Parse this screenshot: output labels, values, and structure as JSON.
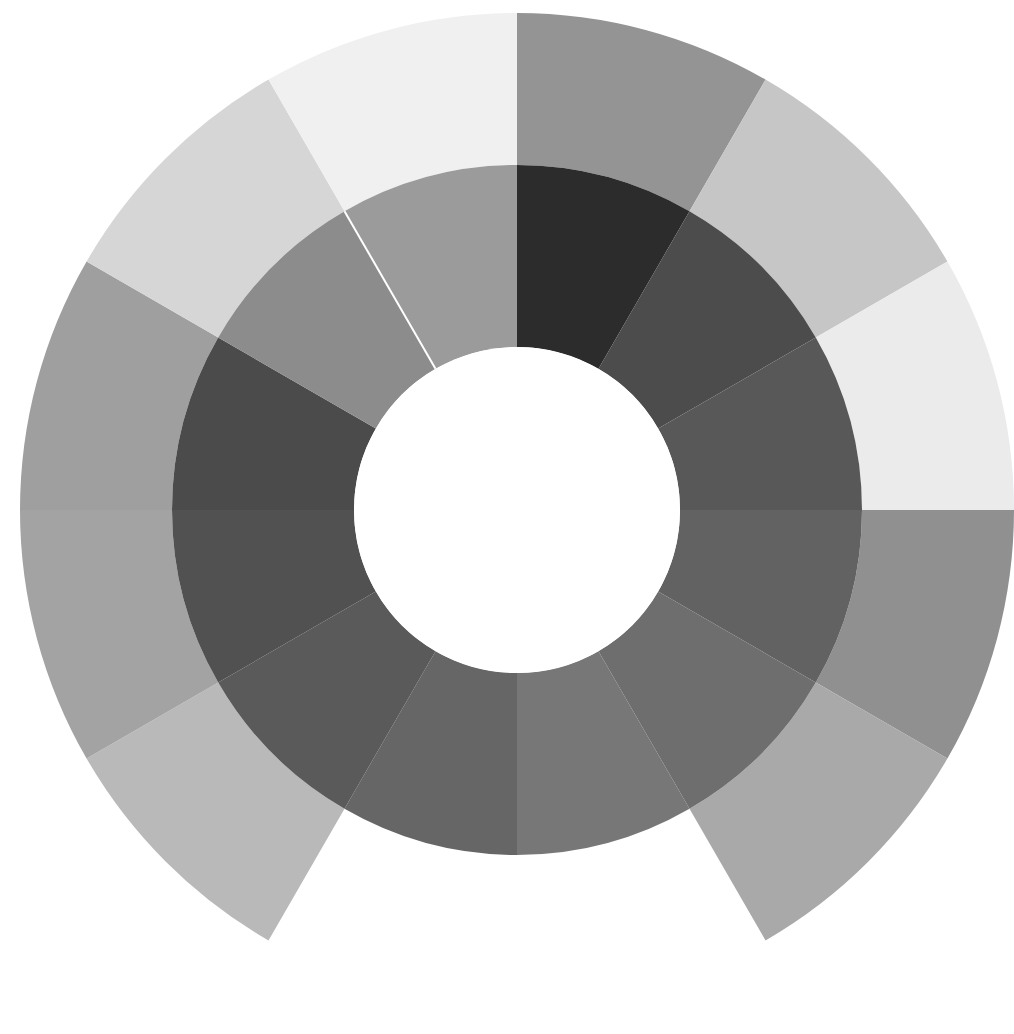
{
  "figure": {
    "kind": "spiral-value-wheel",
    "background_color": "#ffffff",
    "canvas": {
      "width": 1014,
      "height": 1034
    }
  },
  "geometry": {
    "center_x": 517,
    "center_y": 510,
    "hub_radius": 163,
    "inner_ring_inner_radius": 163,
    "inner_ring_outer_radius": 345,
    "outer_ring_inner_radius": 345,
    "outer_ring_outer_radius": 497,
    "sector_count": 12,
    "sector_degrees": 30,
    "start_angle_deg": 0,
    "direction": "clockwise",
    "outer_ring_sweep_deg": 330,
    "inner_ring_sweep_deg": 360,
    "spiral_seam_angle_deg": 330,
    "hub_color": "#ffffff"
  },
  "chart_data": {
    "type": "pie",
    "subtitle": "Two concentric rings of 12 equal 30° sectors, rendered as a spiral",
    "xlabel": "",
    "ylabel": "",
    "legend_position": "none",
    "grid": false,
    "categories": [
      "0°–30°",
      "30°–60°",
      "60°–90°",
      "90°–120°",
      "120°–150°",
      "150°–180°",
      "180°–210°",
      "210°–240°",
      "240°–270°",
      "270°–300°",
      "300°–330°",
      "330°–360°"
    ],
    "values": [
      30,
      30,
      30,
      30,
      30,
      30,
      30,
      30,
      30,
      30,
      30,
      30
    ],
    "series": [
      {
        "name": "Inner ring",
        "ring": "inner",
        "inner_radius": 163,
        "outer_radius": 345,
        "values": [
          30,
          30,
          30,
          30,
          30,
          30,
          30,
          30,
          30,
          30,
          30,
          30
        ],
        "colors": [
          "#2c2c2c",
          "#4c4c4c",
          "#585858",
          "#626262",
          "#6e6e6e",
          "#777777",
          "#666666",
          "#5a5a5a",
          "#515151",
          "#4b4b4b",
          "#8c8c8c",
          "#9b9b9b"
        ]
      },
      {
        "name": "Outer ring",
        "ring": "outer",
        "inner_radius": 345,
        "outer_radius": 497,
        "values": [
          30,
          30,
          30,
          30,
          30,
          0,
          0,
          30,
          30,
          30,
          30,
          30
        ],
        "colors": [
          "#949494",
          "#c6c6c6",
          "#ebebeb",
          "#909090",
          "#a9a9a9",
          null,
          null,
          "#b9b9b9",
          "#a3a3a3",
          "#9f9f9f",
          "#d6d6d6",
          "#f0f0f0"
        ]
      }
    ]
  },
  "palette": {
    "darkest": "#2c2c2c",
    "lightest": "#f0f0f0",
    "paper": "#ffffff",
    "seam": "#ffffff"
  }
}
